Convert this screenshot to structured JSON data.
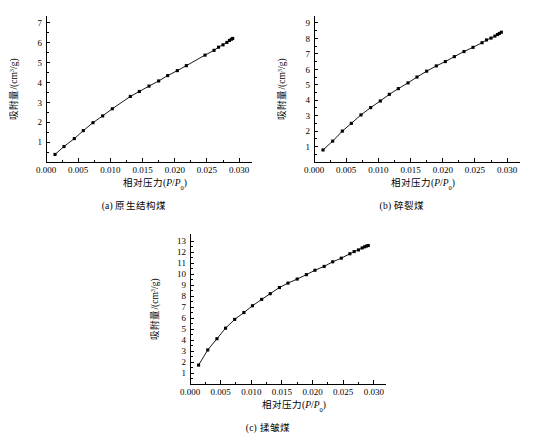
{
  "figure": {
    "axis_x_title": "相对压力(P/P0)",
    "axis_x_title_main": "相对压力(",
    "axis_x_title_italic": "P",
    "axis_x_title_slash": "/",
    "axis_x_title_italic2": "P",
    "axis_x_title_sub": "0",
    "axis_x_title_close": ")",
    "axis_y_title_main": "吸附量/(cm",
    "axis_y_title_sup": "3",
    "axis_y_title_end": "/g)"
  },
  "panels": [
    {
      "id": "a",
      "caption": "(a) 原生结构煤",
      "caption_label": "(a)",
      "caption_name": "原生结构煤"
    },
    {
      "id": "b",
      "caption": "(b) 碎裂煤",
      "caption_label": "(b)",
      "caption_name": "碎裂煤"
    },
    {
      "id": "c",
      "caption": "(c) 揉皱煤",
      "caption_label": "(c)",
      "caption_name": "揉皱煤"
    }
  ],
  "chart_data": [
    {
      "type": "scatter",
      "panel": "a",
      "title": "(a) 原生结构煤",
      "xlabel": "相对压力(P/P0)",
      "ylabel": "吸附量/(cm3/g)",
      "xlim": [
        0.0,
        0.032
      ],
      "ylim": [
        0.0,
        7.35
      ],
      "xticks": [
        0.0,
        0.005,
        0.01,
        0.015,
        0.02,
        0.025,
        0.03
      ],
      "xtick_labels": [
        "0.000",
        "0.005",
        "0.010",
        "0.015",
        "0.020",
        "0.025",
        "0.030"
      ],
      "yticks": [
        1,
        2,
        3,
        4,
        5,
        6,
        7
      ],
      "ytick_labels": [
        "1",
        "2",
        "3",
        "4",
        "5",
        "6",
        "7"
      ],
      "grid": false,
      "legend": "none",
      "marker": "filled-square",
      "x": [
        0.0014,
        0.0028,
        0.0044,
        0.0058,
        0.0073,
        0.0088,
        0.0103,
        0.0131,
        0.0145,
        0.016,
        0.0175,
        0.0189,
        0.0204,
        0.0218,
        0.0247,
        0.0261,
        0.0268,
        0.0275,
        0.0281,
        0.0285,
        0.0288,
        0.029
      ],
      "y": [
        0.38,
        0.78,
        1.18,
        1.58,
        1.98,
        2.32,
        2.68,
        3.3,
        3.55,
        3.82,
        4.08,
        4.35,
        4.6,
        4.85,
        5.38,
        5.62,
        5.78,
        5.9,
        6.02,
        6.12,
        6.18,
        6.22
      ]
    },
    {
      "type": "scatter",
      "panel": "b",
      "title": "(b) 碎裂煤",
      "xlabel": "相对压力(P/P0)",
      "ylabel": "吸附量/(cm3/g)",
      "xlim": [
        0.0,
        0.032
      ],
      "ylim": [
        0.0,
        9.45
      ],
      "xticks": [
        0.0,
        0.005,
        0.01,
        0.015,
        0.02,
        0.025,
        0.03
      ],
      "xtick_labels": [
        "0.000",
        "0.005",
        "0.010",
        "0.015",
        "0.020",
        "0.025",
        "0.030"
      ],
      "yticks": [
        1,
        2,
        3,
        4,
        5,
        6,
        7,
        8,
        9
      ],
      "ytick_labels": [
        "1",
        "2",
        "3",
        "4",
        "5",
        "6",
        "7",
        "8",
        "9"
      ],
      "grid": false,
      "legend": "none",
      "marker": "filled-square",
      "x": [
        0.0014,
        0.0029,
        0.0044,
        0.0058,
        0.0073,
        0.0088,
        0.0103,
        0.0117,
        0.0131,
        0.0146,
        0.016,
        0.0175,
        0.019,
        0.0204,
        0.0218,
        0.0233,
        0.0247,
        0.0261,
        0.0268,
        0.0275,
        0.0281,
        0.0285,
        0.0288,
        0.0291
      ],
      "y": [
        0.78,
        1.35,
        2.0,
        2.5,
        3.05,
        3.52,
        3.95,
        4.38,
        4.75,
        5.12,
        5.5,
        5.88,
        6.22,
        6.5,
        6.82,
        7.15,
        7.42,
        7.72,
        7.9,
        8.02,
        8.15,
        8.25,
        8.32,
        8.4
      ]
    },
    {
      "type": "scatter",
      "panel": "c",
      "title": "(c) 揉皱煤",
      "xlabel": "相对压力(P/P0)",
      "ylabel": "吸附量/(cm3/g)",
      "xlim": [
        0.0,
        0.032
      ],
      "ylim": [
        0.0,
        13.65
      ],
      "xticks": [
        0.0,
        0.005,
        0.01,
        0.015,
        0.02,
        0.025,
        0.03
      ],
      "xtick_labels": [
        "0.000",
        "0.005",
        "0.010",
        "0.015",
        "0.020",
        "0.025",
        "0.030"
      ],
      "yticks": [
        1,
        2,
        3,
        4,
        5,
        6,
        7,
        8,
        9,
        10,
        11,
        12,
        13
      ],
      "ytick_labels": [
        "1",
        "2",
        "3",
        "4",
        "5",
        "6",
        "7",
        "8",
        "9",
        "10",
        "11",
        "12",
        "13"
      ],
      "grid": false,
      "legend": "none",
      "marker": "filled-square",
      "x": [
        0.0014,
        0.0029,
        0.0044,
        0.0058,
        0.0073,
        0.0088,
        0.0102,
        0.0117,
        0.0131,
        0.0146,
        0.016,
        0.0175,
        0.019,
        0.0204,
        0.0219,
        0.0233,
        0.0247,
        0.0261,
        0.0268,
        0.0275,
        0.0281,
        0.0285,
        0.0288,
        0.0291
      ],
      "y": [
        1.72,
        3.1,
        4.12,
        5.08,
        5.88,
        6.5,
        7.12,
        7.7,
        8.22,
        8.78,
        9.18,
        9.55,
        9.95,
        10.35,
        10.7,
        11.12,
        11.45,
        11.85,
        12.05,
        12.2,
        12.38,
        12.48,
        12.55,
        12.6
      ]
    }
  ]
}
